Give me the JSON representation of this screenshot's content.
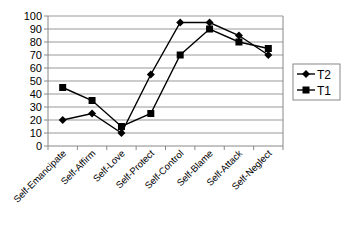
{
  "chart_data": {
    "type": "line",
    "title": "",
    "xlabel": "",
    "ylabel": "",
    "ylim": [
      0,
      100
    ],
    "yticks": [
      0,
      10,
      20,
      30,
      40,
      50,
      60,
      70,
      80,
      90,
      100
    ],
    "grid": true,
    "legend_position": "right",
    "categories": [
      "Self-Emancipate",
      "Self-Affirm",
      "Self-Love",
      "Self-Protect",
      "Self-Control",
      "Self-Blame",
      "Self-Attack",
      "Self-Neglect"
    ],
    "series": [
      {
        "name": "T2",
        "marker": "diamond",
        "values": [
          20,
          25,
          10,
          55,
          95,
          95,
          85,
          70
        ]
      },
      {
        "name": "T1",
        "marker": "square",
        "values": [
          45,
          35,
          15,
          25,
          70,
          90,
          80,
          75
        ]
      }
    ]
  },
  "colors": {
    "line": "#000000",
    "grid": "#999999",
    "axis": "#888888"
  }
}
